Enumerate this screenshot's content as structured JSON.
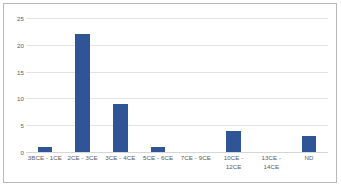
{
  "chart_data": {
    "type": "bar",
    "title": "",
    "subtitle": "",
    "xlabel": "",
    "ylabel": "",
    "categories": [
      "3BCE - 1CE",
      "2CE - 3CE",
      "3CE - 4CE",
      "5CE - 6CE",
      "7CE - 9CE",
      "10CE -\n12CE",
      "13CE -\n14CE",
      "ND"
    ],
    "values": [
      1,
      22,
      9,
      1,
      0,
      4,
      0,
      3
    ],
    "ylim": [
      0,
      25
    ],
    "ytick_labels": [
      "0",
      "5",
      "10",
      "15",
      "20",
      "25"
    ],
    "ytick_values": [
      0,
      5,
      10,
      15,
      20,
      25
    ],
    "grid": true,
    "legend": false,
    "legend_position": "none",
    "bar_color": "#2F5597",
    "gridline_color": "#E2E2E2",
    "axis_text_color": "#5A5A5A",
    "border_color": "#B9B9B9",
    "background_color": "#FFFFFF"
  }
}
